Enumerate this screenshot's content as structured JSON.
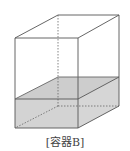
{
  "diagram": {
    "title": "[容器B]",
    "colors": {
      "edge": "#555555",
      "water_fill": "#d3d3d3",
      "water_top_fill": "#cfcfcf",
      "background": "#ffffff"
    },
    "vertices": {
      "front_top_left": [
        15,
        38
      ],
      "front_top_right": [
        78,
        38
      ],
      "back_top_left": [
        58,
        15
      ],
      "back_top_right": [
        119,
        15
      ],
      "front_bottom_left": [
        15,
        128
      ],
      "front_bottom_right": [
        78,
        128
      ],
      "back_bottom_left": [
        58,
        106
      ],
      "back_bottom_right": [
        119,
        106
      ],
      "water_front_left": [
        15,
        99
      ],
      "water_front_right": [
        78,
        99
      ],
      "water_back_left": [
        58,
        77
      ],
      "water_back_right": [
        119,
        77
      ]
    }
  }
}
